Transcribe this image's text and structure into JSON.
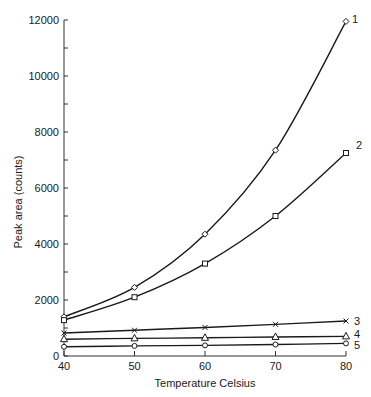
{
  "chart_data": {
    "type": "line",
    "title": "",
    "xlabel": "Temperature Celsius",
    "ylabel": "Peak area (counts)",
    "xlim": [
      40,
      80
    ],
    "ylim": [
      0,
      12000
    ],
    "x_ticks": [
      40,
      50,
      60,
      70,
      80
    ],
    "y_ticks": [
      0,
      2000,
      4000,
      6000,
      8000,
      10000,
      12000
    ],
    "y_minor_step": 1000,
    "grid": false,
    "legend": "inline labels at right end of each curve",
    "x": [
      40,
      50,
      60,
      70,
      80
    ],
    "series": [
      {
        "name": "1",
        "marker": "diamond",
        "values": [
          1400,
          2450,
          4350,
          7350,
          11950
        ]
      },
      {
        "name": "2",
        "marker": "square",
        "values": [
          1280,
          2100,
          3300,
          5000,
          7250
        ]
      },
      {
        "name": "3",
        "marker": "x",
        "values": [
          820,
          920,
          1020,
          1130,
          1250
        ]
      },
      {
        "name": "4",
        "marker": "triangle",
        "values": [
          600,
          630,
          650,
          680,
          700
        ]
      },
      {
        "name": "5",
        "marker": "circle",
        "values": [
          330,
          360,
          380,
          410,
          450
        ]
      }
    ],
    "colors": {
      "line": "#1a1a1a",
      "axis": "#333333",
      "background": "#ffffff"
    }
  }
}
